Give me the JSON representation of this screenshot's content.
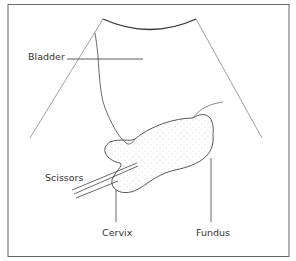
{
  "diagram": {
    "labels": {
      "bladder": "Bladder",
      "scissors": "Scissors",
      "cervix": "Cervix",
      "fundus": "Fundus"
    },
    "colors": {
      "line": "#444444",
      "frame": "#666666",
      "stipple": "#999999"
    }
  }
}
